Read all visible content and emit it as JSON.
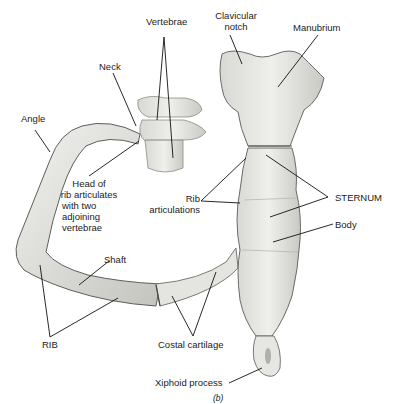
{
  "figure": {
    "caption": "(b)"
  },
  "labels": {
    "vertebrae": "Vertebrae",
    "clavicular_notch_1": "Clavicular",
    "clavicular_notch_2": "notch",
    "manubrium": "Manubrium",
    "neck": "Neck",
    "angle": "Angle",
    "head_1": "Head of",
    "head_2": "rib articulates",
    "head_3": "with two",
    "head_4": "adjoining",
    "head_5": "vertebrae",
    "rib_art_1": "Rib",
    "rib_art_2": "articulations",
    "sternum": "STERNUM",
    "body": "Body",
    "shaft": "Shaft",
    "rib": "RIB",
    "costal_cartilage": "Costal cartilage",
    "xiphoid_process": "Xiphoid process"
  },
  "colors": {
    "bone_fill": "#e9e9e6",
    "bone_shade": "#b9b9b4",
    "bone_outline": "#6a6a66",
    "leader_line": "#111111"
  }
}
